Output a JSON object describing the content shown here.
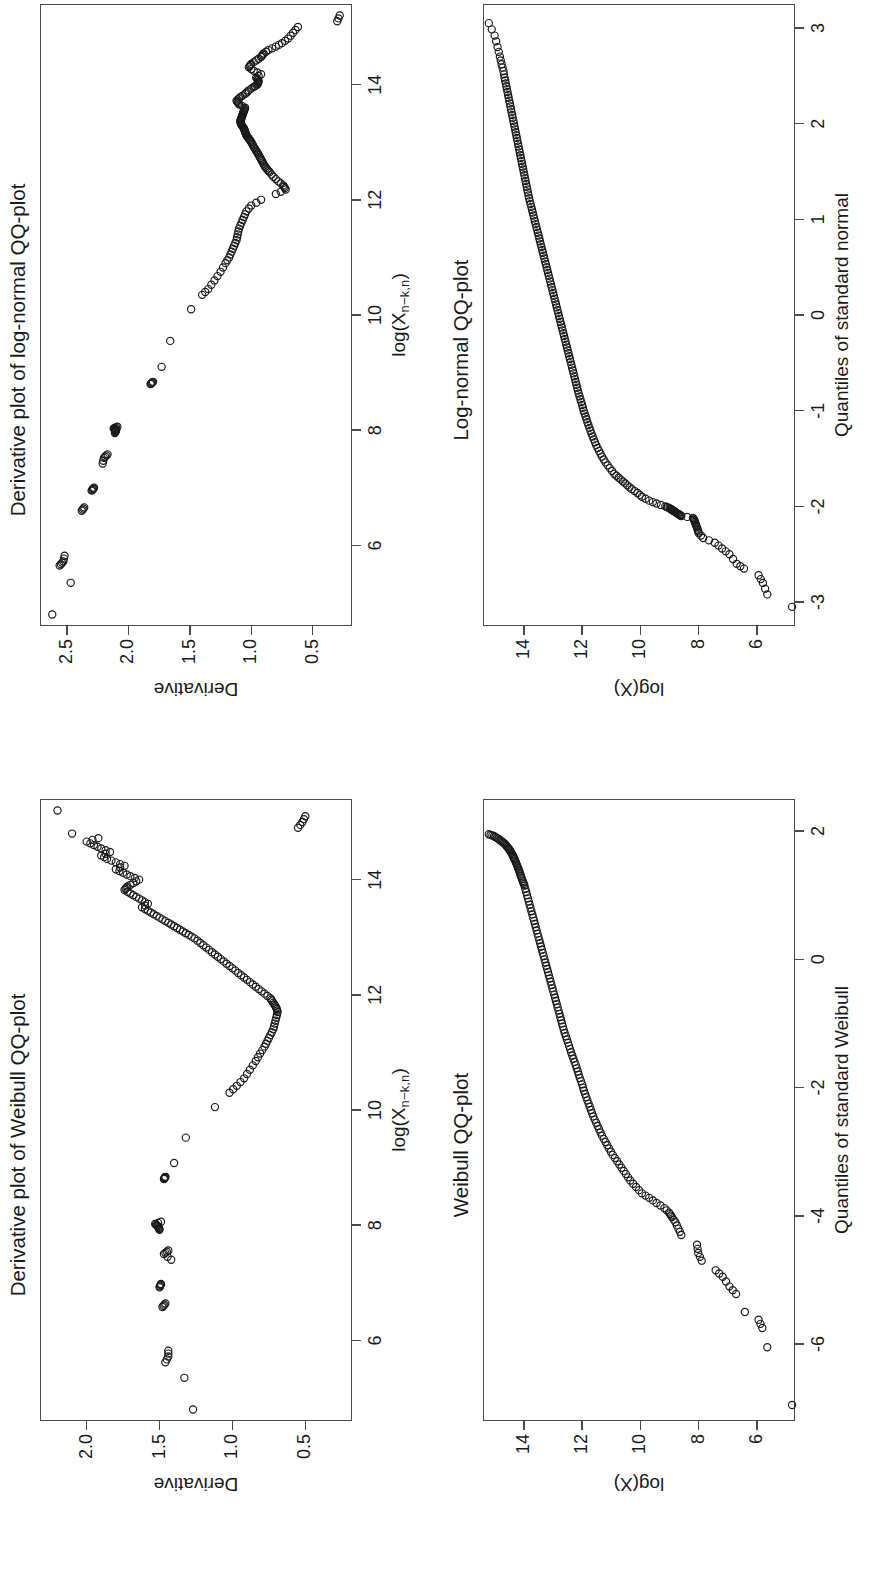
{
  "figure": {
    "orientation": "rotated-90-ccw",
    "background": "#ffffff",
    "ink": "#1a1a1a",
    "panel_count": 4
  },
  "chart_data": [
    {
      "id": "log-normal-qq",
      "type": "scatter",
      "title": "Log-normal QQ-plot",
      "xlabel": "Quantiles of standard normal",
      "ylabel": "log(X)",
      "xticks": [
        -3,
        -2,
        -1,
        0,
        1,
        2,
        3
      ],
      "xticklabels": [
        "-3",
        "-2",
        "-1",
        "0",
        "1",
        "2",
        "3"
      ],
      "yticks": [
        6,
        8,
        10,
        12,
        14
      ],
      "yticklabels": [
        "6",
        "8",
        "10",
        "12",
        "14"
      ],
      "xlim": [
        -3.25,
        3.25
      ],
      "ylim": [
        4.7,
        15.4
      ],
      "grid": false,
      "legend": null,
      "marker": "open-circle",
      "series": [
        {
          "name": "empirical quantiles",
          "x": [
            -3.05,
            -2.92,
            -2.8,
            -2.72,
            -2.65,
            -2.6,
            -2.5,
            -2.44,
            -2.38,
            -2.33,
            -2.28,
            -2.23,
            -2.19,
            -2.15,
            -2.12,
            -2.1,
            -2.08,
            -2.06,
            -2.04,
            -2.02,
            -2.0,
            -1.97,
            -1.94,
            -1.9,
            -1.86,
            -1.82,
            -1.78,
            -1.74,
            -1.7,
            -1.66,
            -1.6,
            -1.54,
            -1.48,
            -1.42,
            -1.36,
            -1.3,
            -1.24,
            -1.18,
            -1.12,
            -1.06,
            -1.0,
            -0.94,
            -0.88,
            -0.82,
            -0.76,
            -0.7,
            -0.64,
            -0.58,
            -0.52,
            -0.46,
            -0.4,
            -0.34,
            -0.28,
            -0.22,
            -0.16,
            -0.1,
            -0.04,
            0.02,
            0.08,
            0.14,
            0.2,
            0.26,
            0.32,
            0.38,
            0.44,
            0.5,
            0.56,
            0.62,
            0.68,
            0.74,
            0.8,
            0.86,
            0.92,
            0.98,
            1.04,
            1.1,
            1.16,
            1.22,
            1.28,
            1.34,
            1.4,
            1.46,
            1.52,
            1.58,
            1.64,
            1.7,
            1.76,
            1.82,
            1.88,
            1.94,
            2.0,
            2.06,
            2.12,
            2.18,
            2.24,
            2.3,
            2.36,
            2.42,
            2.48,
            2.55,
            2.62,
            2.7,
            2.8,
            2.92,
            3.05
          ],
          "y": [
            4.8,
            5.65,
            5.8,
            5.95,
            6.45,
            6.7,
            6.95,
            7.2,
            7.45,
            7.85,
            8.0,
            8.05,
            8.1,
            8.15,
            8.2,
            8.6,
            8.7,
            8.8,
            8.9,
            9.0,
            9.15,
            9.45,
            9.7,
            9.95,
            10.1,
            10.3,
            10.45,
            10.6,
            10.75,
            10.9,
            11.05,
            11.2,
            11.32,
            11.42,
            11.52,
            11.6,
            11.68,
            11.75,
            11.82,
            11.88,
            11.95,
            12.0,
            12.06,
            12.12,
            12.17,
            12.22,
            12.27,
            12.32,
            12.37,
            12.42,
            12.47,
            12.52,
            12.57,
            12.62,
            12.67,
            12.72,
            12.77,
            12.82,
            12.87,
            12.92,
            12.97,
            13.02,
            13.07,
            13.12,
            13.17,
            13.22,
            13.27,
            13.32,
            13.37,
            13.42,
            13.47,
            13.52,
            13.57,
            13.62,
            13.67,
            13.72,
            13.77,
            13.82,
            13.86,
            13.9,
            13.94,
            13.98,
            14.02,
            14.06,
            14.1,
            14.14,
            14.18,
            14.22,
            14.26,
            14.3,
            14.34,
            14.38,
            14.42,
            14.46,
            14.5,
            14.54,
            14.58,
            14.62,
            14.66,
            14.7,
            14.76,
            14.82,
            14.9,
            15.0,
            15.2
          ]
        }
      ]
    },
    {
      "id": "derivative-log-normal-qq",
      "type": "scatter",
      "title": "Derivative plot of log-normal QQ-plot",
      "xlabel": "log(Xn-k,n)",
      "xlabel_parts": {
        "base": "log(X",
        "sub": "n−k,n",
        "tail": ")"
      },
      "ylabel": "Derivative",
      "xticks": [
        6,
        8,
        10,
        12,
        14
      ],
      "xticklabels": [
        "6",
        "8",
        "10",
        "12",
        "14"
      ],
      "yticks": [
        0.5,
        1.0,
        1.5,
        2.0,
        2.5
      ],
      "yticklabels": [
        "0.5",
        "1.0",
        "1.5",
        "2.0",
        "2.5"
      ],
      "xlim": [
        4.6,
        15.4
      ],
      "ylim": [
        0.18,
        2.72
      ],
      "grid": false,
      "legend": null,
      "marker": "open-circle",
      "series": [
        {
          "name": "derivative",
          "x": [
            4.8,
            5.35,
            5.65,
            5.72,
            5.82,
            6.6,
            6.66,
            6.95,
            7.0,
            7.42,
            7.52,
            7.58,
            7.95,
            8.0,
            8.03,
            8.06,
            8.8,
            8.84,
            9.1,
            9.55,
            10.1,
            10.35,
            10.45,
            10.6,
            10.75,
            10.9,
            11.0,
            11.1,
            11.2,
            11.3,
            11.4,
            11.5,
            11.6,
            11.7,
            11.8,
            11.9,
            12.0,
            12.1,
            12.18,
            12.25,
            12.32,
            12.4,
            12.48,
            12.55,
            12.62,
            12.7,
            12.78,
            12.85,
            12.92,
            13.0,
            13.06,
            13.12,
            13.18,
            13.24,
            13.3,
            13.36,
            13.42,
            13.48,
            13.54,
            13.6,
            13.66,
            13.72,
            13.78,
            13.84,
            13.9,
            13.96,
            14.0,
            14.06,
            14.12,
            14.18,
            14.24,
            14.3,
            14.36,
            14.42,
            14.48,
            14.54,
            14.6,
            14.66,
            14.72,
            14.8,
            14.9,
            15.0,
            15.1,
            15.2
          ],
          "y": [
            2.62,
            2.47,
            2.56,
            2.53,
            2.52,
            2.38,
            2.36,
            2.3,
            2.28,
            2.21,
            2.2,
            2.17,
            2.11,
            2.1,
            2.12,
            2.09,
            1.82,
            1.8,
            1.73,
            1.66,
            1.49,
            1.4,
            1.35,
            1.3,
            1.25,
            1.21,
            1.18,
            1.16,
            1.14,
            1.12,
            1.11,
            1.1,
            1.08,
            1.06,
            1.04,
            1.0,
            0.92,
            0.8,
            0.72,
            0.74,
            0.78,
            0.82,
            0.85,
            0.88,
            0.9,
            0.92,
            0.94,
            0.96,
            0.98,
            1.0,
            1.02,
            1.04,
            1.05,
            1.06,
            1.08,
            1.09,
            1.08,
            1.07,
            1.06,
            1.05,
            1.1,
            1.12,
            1.09,
            1.05,
            1.02,
            0.98,
            0.95,
            0.94,
            0.96,
            0.92,
            0.98,
            1.02,
            1.0,
            0.96,
            0.92,
            0.9,
            0.86,
            0.8,
            0.75,
            0.7,
            0.66,
            0.62,
            0.3,
            0.28
          ]
        }
      ]
    },
    {
      "id": "weibull-qq",
      "type": "scatter",
      "title": "Weibull QQ-plot",
      "xlabel": "Quantiles of standard Weibull",
      "ylabel": "log(X)",
      "xticks": [
        -6,
        -4,
        -2,
        0,
        2
      ],
      "xticklabels": [
        "-6",
        "-4",
        "-2",
        "0",
        "2"
      ],
      "yticks": [
        6,
        8,
        10,
        12,
        14
      ],
      "yticklabels": [
        "6",
        "8",
        "10",
        "12",
        "14"
      ],
      "xlim": [
        -7.2,
        2.5
      ],
      "ylim": [
        4.7,
        15.4
      ],
      "grid": false,
      "legend": null,
      "marker": "open-circle",
      "series": [
        {
          "name": "empirical quantiles",
          "x": [
            -6.95,
            -6.05,
            -5.75,
            -5.62,
            -5.5,
            -5.22,
            -5.1,
            -4.95,
            -4.85,
            -4.7,
            -4.58,
            -4.45,
            -4.3,
            -4.2,
            -4.1,
            -4.02,
            -3.95,
            -3.88,
            -3.8,
            -3.72,
            -3.65,
            -3.55,
            -3.45,
            -3.35,
            -3.25,
            -3.15,
            -3.05,
            -2.95,
            -2.85,
            -2.75,
            -2.65,
            -2.55,
            -2.45,
            -2.35,
            -2.25,
            -2.15,
            -2.05,
            -1.95,
            -1.85,
            -1.75,
            -1.65,
            -1.55,
            -1.45,
            -1.35,
            -1.25,
            -1.15,
            -1.05,
            -0.95,
            -0.85,
            -0.75,
            -0.65,
            -0.55,
            -0.45,
            -0.35,
            -0.25,
            -0.15,
            -0.05,
            0.05,
            0.15,
            0.25,
            0.35,
            0.45,
            0.55,
            0.65,
            0.75,
            0.85,
            0.95,
            1.05,
            1.15,
            1.22,
            1.3,
            1.38,
            1.45,
            1.52,
            1.58,
            1.64,
            1.7,
            1.75,
            1.8,
            1.84,
            1.88,
            1.92,
            1.95
          ],
          "y": [
            4.8,
            5.65,
            5.82,
            5.95,
            6.42,
            6.72,
            6.95,
            7.18,
            7.42,
            7.9,
            8.02,
            8.06,
            8.6,
            8.7,
            8.8,
            8.92,
            9.02,
            9.18,
            9.45,
            9.7,
            9.95,
            10.15,
            10.35,
            10.5,
            10.65,
            10.8,
            10.95,
            11.08,
            11.2,
            11.32,
            11.42,
            11.52,
            11.62,
            11.7,
            11.78,
            11.86,
            11.94,
            12.0,
            12.08,
            12.15,
            12.22,
            12.3,
            12.38,
            12.45,
            12.52,
            12.6,
            12.66,
            12.72,
            12.78,
            12.84,
            12.9,
            12.96,
            13.02,
            13.08,
            13.14,
            13.2,
            13.26,
            13.32,
            13.38,
            13.44,
            13.5,
            13.56,
            13.62,
            13.68,
            13.74,
            13.8,
            13.86,
            13.92,
            13.98,
            14.04,
            14.1,
            14.16,
            14.22,
            14.28,
            14.34,
            14.4,
            14.48,
            14.56,
            14.65,
            14.76,
            14.88,
            15.02,
            15.2
          ]
        }
      ]
    },
    {
      "id": "derivative-weibull-qq",
      "type": "scatter",
      "title": "Derivative plot of Weibull QQ-plot",
      "xlabel": "log(Xn-k,n)",
      "xlabel_parts": {
        "base": "log(X",
        "sub": "n−k,n",
        "tail": ")"
      },
      "ylabel": "Derivative",
      "xticks": [
        6,
        8,
        10,
        12,
        14
      ],
      "xticklabels": [
        "6",
        "8",
        "10",
        "12",
        "14"
      ],
      "yticks": [
        0.5,
        1.0,
        1.5,
        2.0
      ],
      "yticklabels": [
        "0.5",
        "1.0",
        "1.5",
        "2.0"
      ],
      "xlim": [
        4.6,
        15.4
      ],
      "ylim": [
        0.18,
        2.32
      ],
      "grid": false,
      "legend": null,
      "marker": "open-circle",
      "series": [
        {
          "name": "derivative",
          "x": [
            4.8,
            5.35,
            5.62,
            5.72,
            5.82,
            6.58,
            6.64,
            6.92,
            6.98,
            7.4,
            7.5,
            7.56,
            7.92,
            7.98,
            8.02,
            8.06,
            8.8,
            8.84,
            9.08,
            9.52,
            10.05,
            10.3,
            10.42,
            10.55,
            10.7,
            10.85,
            10.98,
            11.1,
            11.2,
            11.3,
            11.4,
            11.5,
            11.6,
            11.7,
            11.78,
            11.86,
            11.94,
            12.02,
            12.1,
            12.18,
            12.26,
            12.34,
            12.42,
            12.5,
            12.58,
            12.66,
            12.74,
            12.82,
            12.9,
            12.98,
            13.04,
            13.1,
            13.16,
            13.22,
            13.28,
            13.34,
            13.4,
            13.46,
            13.52,
            13.58,
            13.64,
            13.7,
            13.76,
            13.82,
            13.88,
            13.94,
            14.0,
            14.06,
            14.12,
            14.18,
            14.24,
            14.3,
            14.36,
            14.42,
            14.48,
            14.54,
            14.6,
            14.66,
            14.72,
            14.8,
            14.9,
            15.0,
            15.1,
            15.2
          ],
          "y": [
            1.27,
            1.33,
            1.46,
            1.44,
            1.44,
            1.48,
            1.46,
            1.5,
            1.49,
            1.42,
            1.47,
            1.44,
            1.5,
            1.51,
            1.53,
            1.49,
            1.47,
            1.46,
            1.4,
            1.32,
            1.12,
            1.02,
            0.97,
            0.92,
            0.88,
            0.84,
            0.81,
            0.78,
            0.76,
            0.74,
            0.72,
            0.71,
            0.7,
            0.69,
            0.7,
            0.72,
            0.74,
            0.78,
            0.82,
            0.86,
            0.9,
            0.94,
            0.98,
            1.02,
            1.06,
            1.1,
            1.14,
            1.18,
            1.22,
            1.26,
            1.3,
            1.34,
            1.38,
            1.42,
            1.46,
            1.5,
            1.54,
            1.58,
            1.62,
            1.58,
            1.62,
            1.66,
            1.7,
            1.74,
            1.72,
            1.68,
            1.64,
            1.7,
            1.75,
            1.8,
            1.74,
            1.8,
            1.86,
            1.9,
            1.84,
            1.9,
            1.95,
            2.0,
            1.92,
            2.1,
            0.55,
            0.52,
            0.5,
            2.2
          ]
        }
      ]
    }
  ]
}
